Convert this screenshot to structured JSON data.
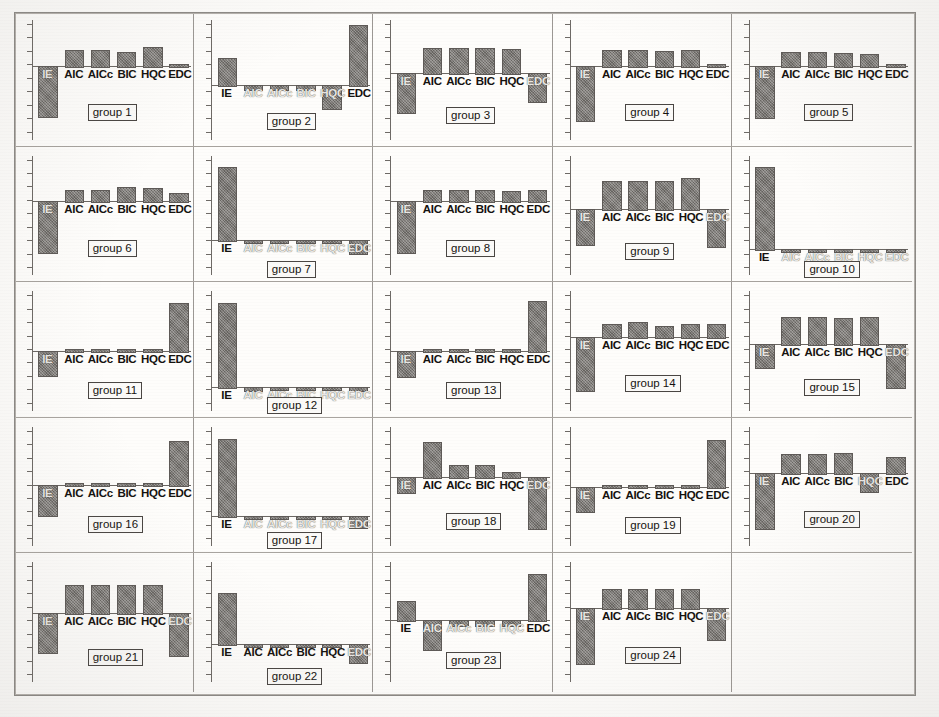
{
  "figure": {
    "kind": "multi-panel-bar-chart-scan",
    "panel_rows": 5,
    "panel_cols": 5,
    "panel_count": 24,
    "bar_fill_color": "#7c7874",
    "axis_color": "#6b6763",
    "page_background": "#fdfcfa"
  },
  "chart_data": {
    "type": "bar",
    "title": "",
    "subtitle": "",
    "xlabel": "",
    "ylabel": "",
    "grid": false,
    "legend": "none",
    "categories": [
      "IE",
      "AIC",
      "AICc",
      "BIC",
      "HQC",
      "EDC"
    ],
    "note": "24 small-multiple panels; each panel plots 6 criterion values about a zero baseline. Values are normalized panel-relative units read off the bar heights.",
    "ylim": [
      -1,
      1
    ],
    "panels": [
      {
        "label": "group 1",
        "values": [
          -0.72,
          0.34,
          0.34,
          0.3,
          0.42,
          0.04
        ]
      },
      {
        "label": "group 2",
        "values": [
          0.42,
          -0.08,
          -0.08,
          -0.08,
          -0.46,
          0.92
        ]
      },
      {
        "label": "group 3",
        "values": [
          -0.62,
          0.48,
          0.48,
          0.48,
          0.46,
          -0.44
        ]
      },
      {
        "label": "group 4",
        "values": [
          -0.78,
          0.34,
          0.34,
          0.32,
          0.34,
          0.04
        ]
      },
      {
        "label": "group 5",
        "values": [
          -0.74,
          0.3,
          0.3,
          0.28,
          0.26,
          0.04
        ]
      },
      {
        "label": "group 6",
        "values": [
          -0.72,
          0.26,
          0.26,
          0.32,
          0.3,
          0.18
        ]
      },
      {
        "label": "group 7",
        "values": [
          0.86,
          -0.08,
          -0.08,
          -0.08,
          -0.08,
          -0.42
        ]
      },
      {
        "label": "group 8",
        "values": [
          -0.72,
          0.26,
          0.26,
          0.24,
          0.22,
          0.24
        ]
      },
      {
        "label": "group 9",
        "values": [
          -0.56,
          0.52,
          0.52,
          0.52,
          0.58,
          -0.6
        ]
      },
      {
        "label": "group 10",
        "values": [
          0.88,
          -0.1,
          -0.1,
          -0.1,
          -0.1,
          -0.1
        ]
      },
      {
        "label": "group 11",
        "values": [
          -0.42,
          0.01,
          0.01,
          0.01,
          0.01,
          0.8
        ]
      },
      {
        "label": "group 12",
        "values": [
          0.88,
          -0.14,
          -0.1,
          -0.1,
          -0.1,
          -0.12
        ]
      },
      {
        "label": "group 13",
        "values": [
          -0.44,
          0.01,
          0.01,
          0.01,
          0.01,
          0.84
        ]
      },
      {
        "label": "group 14",
        "values": [
          -0.76,
          0.28,
          0.32,
          0.24,
          0.28,
          0.28
        ]
      },
      {
        "label": "group 15",
        "values": [
          -0.36,
          0.52,
          0.52,
          0.5,
          0.52,
          -0.68
        ]
      },
      {
        "label": "group 16",
        "values": [
          -0.52,
          0.02,
          0.02,
          0.02,
          0.02,
          0.76
        ]
      },
      {
        "label": "group 17",
        "values": [
          0.86,
          -0.1,
          -0.1,
          -0.1,
          -0.1,
          -0.42
        ]
      },
      {
        "label": "group 18",
        "values": [
          -0.22,
          0.7,
          0.24,
          0.24,
          0.1,
          -0.78
        ]
      },
      {
        "label": "group 19",
        "values": [
          -0.44,
          0.01,
          0.01,
          0.01,
          0.01,
          0.78
        ]
      },
      {
        "label": "group 20",
        "values": [
          -0.8,
          0.4,
          0.4,
          0.42,
          -0.26,
          0.34
        ]
      },
      {
        "label": "group 21",
        "values": [
          -0.6,
          0.56,
          0.56,
          0.56,
          0.56,
          -0.64
        ]
      },
      {
        "label": "group 22",
        "values": [
          0.62,
          -0.06,
          -0.06,
          -0.06,
          -0.06,
          -0.52
        ]
      },
      {
        "label": "group 23",
        "values": [
          0.34,
          -0.5,
          -0.08,
          -0.08,
          -0.08,
          0.8
        ]
      },
      {
        "label": "group 24",
        "values": [
          -0.78,
          0.42,
          0.42,
          0.42,
          0.42,
          -0.44
        ]
      }
    ]
  }
}
